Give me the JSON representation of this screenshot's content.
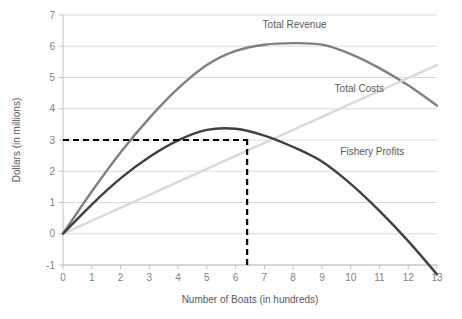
{
  "chart_data": {
    "type": "line",
    "title": "",
    "xlabel": "Number of Boats (in hundreds)",
    "ylabel": "Dollars (in millions)",
    "xlim": [
      0,
      13
    ],
    "ylim": [
      -1,
      7
    ],
    "grid": true,
    "legend_position": "inline-annotations",
    "xticks": [
      "0",
      "1",
      "2",
      "3",
      "4",
      "5",
      "6",
      "7",
      "8",
      "9",
      "10",
      "11",
      "12",
      "13"
    ],
    "xtick_values": [
      0,
      1,
      2,
      3,
      4,
      5,
      6,
      7,
      8,
      9,
      10,
      11,
      12,
      13
    ],
    "yticks": [
      "-1",
      "0",
      "1",
      "2",
      "3",
      "4",
      "5",
      "6",
      "7"
    ],
    "ytick_values": [
      -1,
      0,
      1,
      2,
      3,
      4,
      5,
      6,
      7
    ],
    "x": [
      0,
      1,
      2,
      3,
      4,
      5,
      6,
      7,
      8,
      9,
      10,
      11,
      12,
      13
    ],
    "series": [
      {
        "name": "Total Revenue",
        "color": "#808080",
        "values": [
          0.0,
          1.35,
          2.6,
          3.7,
          4.65,
          5.4,
          5.85,
          6.05,
          6.1,
          6.05,
          5.75,
          5.3,
          4.75,
          4.1
        ]
      },
      {
        "name": "Total Costs",
        "color": "#d9d9d9",
        "values": [
          0.0,
          0.415,
          0.83,
          1.246,
          1.662,
          2.077,
          2.492,
          2.908,
          3.323,
          3.738,
          4.154,
          4.569,
          4.985,
          5.4
        ]
      },
      {
        "name": "Fishery Profits",
        "color": "#404040",
        "values": [
          0.0,
          0.935,
          1.77,
          2.454,
          2.988,
          3.323,
          3.358,
          3.142,
          2.777,
          2.312,
          1.596,
          0.731,
          -0.235,
          -1.3
        ]
      }
    ],
    "annotations": [
      {
        "name": "total-revenue-label",
        "text": "Total Revenue",
        "x": 8.05,
        "y": 6.6
      },
      {
        "name": "total-costs-label",
        "text": "Total Costs",
        "x": 10.3,
        "y": 4.55
      },
      {
        "name": "fishery-profits-label",
        "text": "Fishery Profits",
        "x": 10.75,
        "y": 2.52
      }
    ],
    "reference_lines": [
      {
        "name": "horizontal-dashed-profit-line",
        "orientation": "horizontal",
        "value": 3,
        "from_x": 0,
        "to_x": 6.4,
        "color": "#000000",
        "style": "dashed"
      },
      {
        "name": "vertical-dashed-boats-line",
        "orientation": "vertical",
        "value": 6.4,
        "from_y": -1,
        "to_y": 3.05,
        "color": "#000000",
        "style": "dashed"
      }
    ]
  }
}
